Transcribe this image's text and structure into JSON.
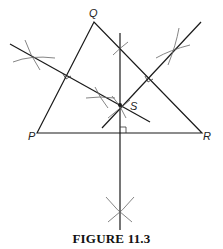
{
  "caption": "FIGURE 11.3",
  "labels": {
    "P": "P",
    "Q": "Q",
    "R": "R",
    "S": "S"
  },
  "diagram": {
    "type": "triangle-perpendicular-bisectors-construction",
    "vertices": {
      "P": [
        37,
        133
      ],
      "Q": [
        94,
        22
      ],
      "R": [
        202,
        133
      ]
    },
    "circumcenter": {
      "name": "S",
      "point": [
        120,
        105
      ]
    },
    "colors": {
      "line": "#1a1a1a",
      "arc": "#666666"
    }
  }
}
